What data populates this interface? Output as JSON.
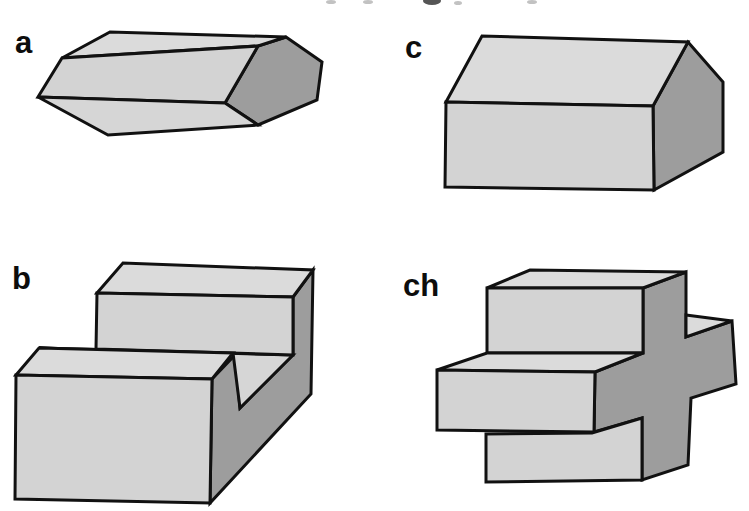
{
  "figure": {
    "panels": [
      {
        "label": "a"
      },
      {
        "label": "b"
      },
      {
        "label": "c"
      },
      {
        "label": "ch"
      }
    ],
    "colors": {
      "face_top": "#dbdbdb",
      "face_front": "#d3d3d3",
      "face_side": "#d6d6d6",
      "face_dark": "#9d9d9d",
      "outline": "#111111",
      "background": "#ffffff"
    }
  }
}
